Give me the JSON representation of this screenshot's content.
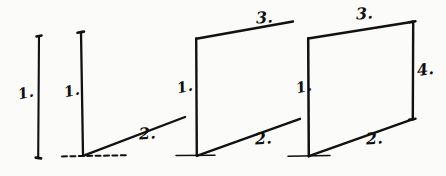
{
  "figure": {
    "background_color": "#fbfbf9",
    "ink_color": "#111111",
    "stages": [
      {
        "name": "stage-1-single-vertical",
        "labels": [
          {
            "id": "label-1",
            "text": "1.",
            "x": 18,
            "y": 86
          }
        ]
      },
      {
        "name": "stage-2-vertical-with-base",
        "labels": [
          {
            "id": "label-1",
            "text": "1.",
            "x": 64,
            "y": 84
          },
          {
            "id": "label-2",
            "text": "2.",
            "x": 139,
            "y": 126
          }
        ]
      },
      {
        "name": "stage-3-open-parallelogram",
        "labels": [
          {
            "id": "label-1",
            "text": "1.",
            "x": 177,
            "y": 80
          },
          {
            "id": "label-2",
            "text": "2.",
            "x": 255,
            "y": 131
          },
          {
            "id": "label-3",
            "text": "3.",
            "x": 256,
            "y": 10
          }
        ]
      },
      {
        "name": "stage-4-closed-parallelogram",
        "labels": [
          {
            "id": "label-1",
            "text": "1.",
            "x": 296,
            "y": 80
          },
          {
            "id": "label-2",
            "text": "2.",
            "x": 366,
            "y": 131
          },
          {
            "id": "label-3",
            "text": "3.",
            "x": 356,
            "y": 6
          },
          {
            "id": "label-4",
            "text": "4.",
            "x": 417,
            "y": 62
          }
        ]
      }
    ]
  }
}
